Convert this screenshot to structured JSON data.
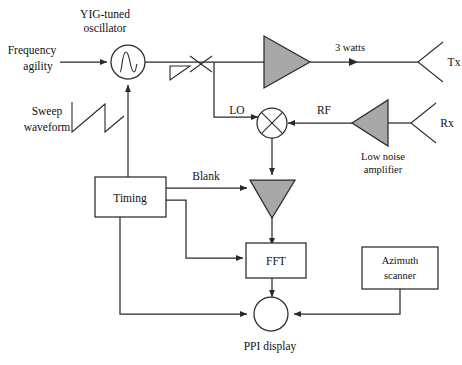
{
  "diagram": {
    "canvas": {
      "width": 462,
      "height": 365
    },
    "colors": {
      "line": "#2a2a2a",
      "amplifier_fill": "#a8a8a8",
      "background": "#ffffff",
      "text": "#111111"
    },
    "labels": {
      "frequency_agility": "Frequency",
      "frequency_agility_2": "agility",
      "yig_line1": "YIG-tuned",
      "yig_line2": "oscillator",
      "sweep_line1": "Sweep",
      "sweep_line2": "waveform",
      "three_watts": "3 watts",
      "tx": "Tx",
      "rx": "Rx",
      "lo": "LO",
      "rf": "RF",
      "low_noise_line1": "Low noise",
      "low_noise_line2": "amplifier",
      "timing": "Timing",
      "blank": "Blank",
      "fft": "FFT",
      "azimuth_line1": "Azimuth",
      "azimuth_line2": "scanner",
      "ppi_display": "PPI display"
    }
  }
}
